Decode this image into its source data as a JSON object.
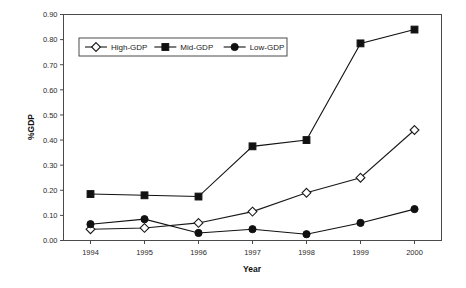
{
  "chart_data": {
    "type": "line",
    "title": "",
    "xlabel": "Year",
    "ylabel": "%GDP",
    "categories": [
      "1994",
      "1995",
      "1996",
      "1997",
      "1998",
      "1999",
      "2000"
    ],
    "x": [
      1994,
      1995,
      1996,
      1997,
      1998,
      1999,
      2000
    ],
    "xlim": [
      1993.5,
      2000.5
    ],
    "ylim": [
      0.0,
      0.9
    ],
    "ytick_labels": [
      "0.00",
      "0.10",
      "0.20",
      "0.30",
      "0.40",
      "0.50",
      "0.60",
      "0.70",
      "0.80",
      "0.90"
    ],
    "ytick_values": [
      0.0,
      0.1,
      0.2,
      0.3,
      0.4,
      0.5,
      0.6,
      0.7,
      0.8,
      0.9
    ],
    "grid": false,
    "legend_position": "top-left-inside",
    "series": [
      {
        "name": "High-GDP",
        "marker": "open-diamond",
        "color": "#1a1a1a",
        "values": [
          0.045,
          0.05,
          0.07,
          0.115,
          0.19,
          0.25,
          0.44
        ]
      },
      {
        "name": "Mid-GDP",
        "marker": "filled-square",
        "color": "#111111",
        "values": [
          0.185,
          0.18,
          0.175,
          0.375,
          0.4,
          0.785,
          0.84
        ]
      },
      {
        "name": "Low-GDP",
        "marker": "filled-circle",
        "color": "#111111",
        "values": [
          0.065,
          0.085,
          0.03,
          0.045,
          0.025,
          0.07,
          0.125
        ]
      }
    ]
  }
}
